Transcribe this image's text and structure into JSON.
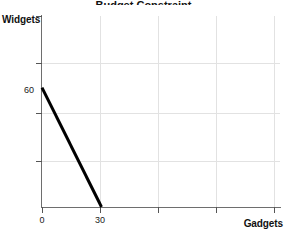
{
  "figure": {
    "title_remnant": "Budget Constraint",
    "background": "#ffffff"
  },
  "axes": {
    "y_title": "Widgets",
    "x_title": "Gadgets",
    "y_tick_labels": [
      "60"
    ],
    "x_tick_labels": [
      "0",
      "30"
    ]
  },
  "chart_data": {
    "type": "line",
    "title": "",
    "xlabel": "Gadgets",
    "ylabel": "Widgets",
    "xlim": [
      0,
      120
    ],
    "ylim": [
      0,
      96
    ],
    "grid": true,
    "legend": "none",
    "x_ticks": [
      0,
      30,
      60,
      90,
      120
    ],
    "x_tick_labels": [
      "0",
      "30",
      "",
      "",
      ""
    ],
    "y_ticks": [
      0,
      24,
      48,
      72,
      96
    ],
    "y_tick_labels": [
      "",
      "",
      "",
      "",
      ""
    ],
    "y_labeled_points": [
      {
        "value": 60,
        "label": "60"
      }
    ],
    "series": [
      {
        "name": "budget-line",
        "color": "#000000",
        "linewidth": 3,
        "x": [
          0,
          30
        ],
        "y": [
          60,
          0
        ]
      }
    ],
    "annotations": []
  }
}
